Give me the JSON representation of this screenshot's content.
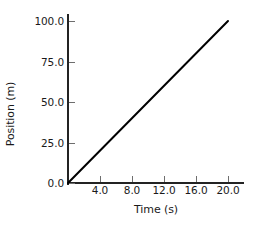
{
  "chart_data": {
    "type": "line",
    "title": "",
    "xlabel": "Time (s)",
    "ylabel": "Position (m)",
    "xlim": [
      0,
      22
    ],
    "ylim": [
      0,
      105
    ],
    "xticks": [
      4.0,
      8.0,
      12.0,
      16.0,
      20.0
    ],
    "yticks": [
      0.0,
      25.0,
      50.0,
      75.0,
      100.0
    ],
    "xtick_labels": [
      "4.0",
      "8.0",
      "12.0",
      "16.0",
      "20.0"
    ],
    "ytick_labels": [
      "0.0",
      "25.0",
      "50.0",
      "75.0",
      "100.0"
    ],
    "grid": false,
    "legend": null,
    "series": [
      {
        "name": "position",
        "color": "#000000",
        "linewidth": 2,
        "x": [
          0.0,
          20.0
        ],
        "values": [
          0.0,
          100.0
        ],
        "points": [
          {
            "x": 0.0,
            "y": 0.0
          },
          {
            "x": 4.0,
            "y": 20.0
          },
          {
            "x": 8.0,
            "y": 40.0
          },
          {
            "x": 12.0,
            "y": 60.0
          },
          {
            "x": 16.0,
            "y": 80.0
          },
          {
            "x": 20.0,
            "y": 100.0
          }
        ],
        "slope": 5.0
      }
    ]
  },
  "colors": {
    "background": "#ffffff",
    "axis": "#232323",
    "tick": "#6e6e6e",
    "line": "#000000",
    "text": "#1a1a1a"
  }
}
